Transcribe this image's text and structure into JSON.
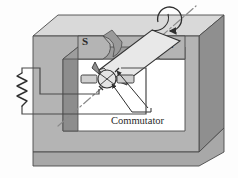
{
  "figure": {
    "kind": "dc-motor-commutator-diagram",
    "background_color": "#fdfdfd",
    "stroke_color": "#3a3a3a"
  },
  "magnet": {
    "name": "u-shaped-permanent-magnet",
    "south_pole_label": "S",
    "north_pole_label": "N",
    "face_top_color": "#d9d9d9",
    "face_front_color": "#b4b4b4",
    "face_side_color": "#8f8f8f",
    "face_inner_color": "#9a9a9a",
    "gap_color": "#ffffff"
  },
  "armature": {
    "name": "rotating-coil-loop",
    "fill_color": "#e8e8e8",
    "shade_color": "#9d9d9d",
    "axis_style": "dash-dot",
    "axis_color": "#8a8a8a"
  },
  "rotation": {
    "name": "rotation-direction-arrow",
    "shape": "circular-arrow"
  },
  "commutator": {
    "name": "split-ring-commutator",
    "label": "Commutator",
    "ring_color": "#e0e0e0",
    "shaft_color": "#cfcfcf"
  },
  "circuit": {
    "name": "external-circuit",
    "resistor_label": "",
    "wire_color": "#4a4a4a"
  }
}
